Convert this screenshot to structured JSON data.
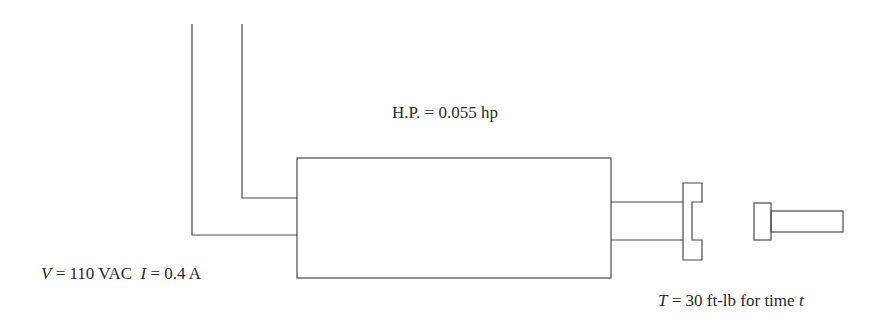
{
  "diagram": {
    "type": "motor-load-schematic",
    "labels": {
      "power": "H.P. = 0.055 hp",
      "voltage_symbol": "V",
      "voltage_value": " = 110 VAC",
      "current_symbol": "I",
      "current_value": " = 0.4 A",
      "torque_symbol": "T",
      "torque_value": " = 30 ft-lb for time ",
      "time_symbol": "t"
    },
    "components": [
      "power-lead-1",
      "power-lead-2",
      "motor-body",
      "motor-shaft",
      "coupling-flange",
      "load-shaft"
    ],
    "colors": {
      "line": "#4a4a4a",
      "text": "#2a2a2a",
      "background": "#ffffff"
    }
  }
}
